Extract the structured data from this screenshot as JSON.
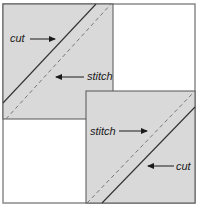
{
  "diagram": {
    "colors": {
      "block_fill": "#d9d9d9",
      "background": "#ffffff",
      "frame": "#8a8a8a",
      "block_border": "#555555",
      "line": "#333333",
      "dashed": "#777777"
    },
    "frame": {
      "x": 3,
      "y": 4,
      "w": 192,
      "h": 199
    },
    "blocks": [
      {
        "name": "top-left-block",
        "x": 3,
        "y": 4,
        "w": 110,
        "h": 115,
        "cut_line": {
          "x1": 3,
          "y1": 103,
          "x2": 96,
          "y2": 4
        },
        "stitch_line": {
          "x1": 6,
          "y1": 119,
          "x2": 111,
          "y2": 4
        },
        "labels": [
          {
            "name": "cut-label",
            "text": "cut",
            "x": 10,
            "y": 42,
            "arrow": {
              "x1": 30,
              "y1": 39,
              "x2": 55,
              "y2": 39
            }
          },
          {
            "name": "stitch-label",
            "text": "stitch",
            "x": 87,
            "y": 80,
            "arrow": {
              "x1": 84,
              "y1": 77,
              "x2": 56,
              "y2": 77
            }
          }
        ]
      },
      {
        "name": "bottom-right-block",
        "x": 86,
        "y": 91,
        "w": 109,
        "h": 112,
        "cut_line": {
          "x1": 102,
          "y1": 203,
          "x2": 195,
          "y2": 107
        },
        "stitch_line": {
          "x1": 87,
          "y1": 203,
          "x2": 194,
          "y2": 92
        },
        "labels": [
          {
            "name": "stitch-label",
            "text": "stitch",
            "x": 90,
            "y": 135,
            "arrow": {
              "x1": 119,
              "y1": 131,
              "x2": 147,
              "y2": 131
            }
          },
          {
            "name": "cut-label",
            "text": "cut",
            "x": 176,
            "y": 170,
            "arrow": {
              "x1": 174,
              "y1": 166,
              "x2": 148,
              "y2": 166
            }
          }
        ]
      }
    ]
  }
}
